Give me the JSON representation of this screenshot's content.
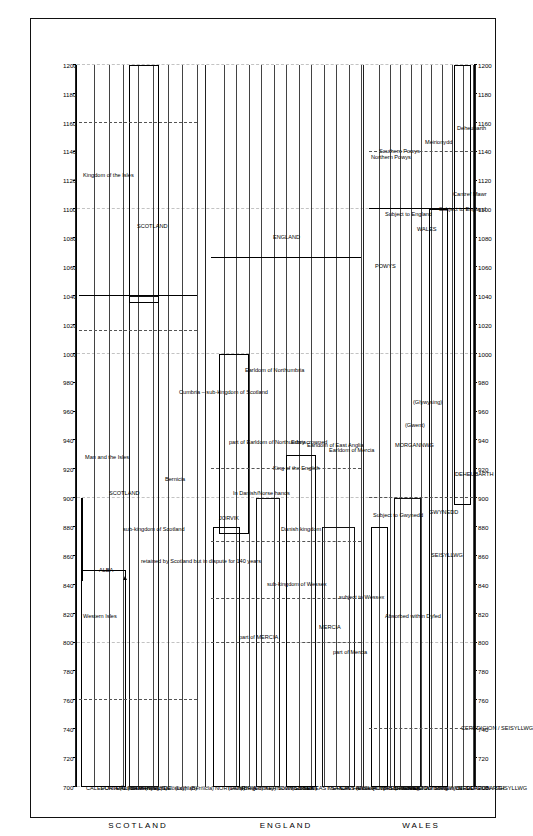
{
  "figure": {
    "orientation": "rotated-90-ccw",
    "axis_title": "",
    "era_labels": [
      "SCOTLAND",
      "ENGLAND",
      "WALES"
    ],
    "region_headers": [
      "SCOTLAND",
      "ENGLAND",
      "WALES"
    ]
  },
  "chart_data": {
    "type": "table",
    "title": "",
    "xlabel": "",
    "ylabel": "",
    "xlim": [
      700,
      1200
    ],
    "x_ticks": [
      700,
      720,
      740,
      760,
      780,
      800,
      820,
      840,
      860,
      880,
      900,
      920,
      940,
      960,
      980,
      1000,
      1020,
      1040,
      1060,
      1080,
      1100,
      1120,
      1140,
      1160,
      1180,
      1200
    ],
    "grid": "dashed-vertical",
    "legend": "none",
    "sections": [
      {
        "name": "SCOTLAND",
        "rows": [
          {
            "label": "CALEDONIA (Northern Picts)",
            "span": [
              700,
              850
            ]
          },
          {
            "label": "FORTRIU (Southern Picts)",
            "span": [
              700,
              850
            ]
          },
          {
            "label": "DÁL RIATA",
            "span": [
              700,
              850
            ]
          },
          {
            "label": "STRATHCLYDE",
            "span": [
              700,
              1040
            ]
          },
          {
            "label": "(Kyle)",
            "span": [
              700,
              760
            ]
          },
          {
            "label": "(Galloway)",
            "span": [
              700,
              1040
            ]
          },
          {
            "label": "(Lothian)",
            "span": [
              700,
              1020
            ]
          },
          {
            "label": "(Bernicia)",
            "span": [
              700,
              960
            ]
          }
        ],
        "annotations": [
          {
            "text": "Western Isles",
            "at": 840
          },
          {
            "text": "Man and the Isles",
            "at": 960
          },
          {
            "text": "Kingdom of the Isles",
            "at": 1150
          },
          {
            "text": "ALBA",
            "at": 870
          },
          {
            "text": "SCOTLAND",
            "at": 960
          },
          {
            "text": "sub-kingdom of Scotland",
            "at": 920
          },
          {
            "text": "retained by Scotland but in dispute for 140 years",
            "at": 940
          },
          {
            "text": "Bernicia",
            "at": 940
          },
          {
            "text": "Cumbria – sub-kingdom of Scotland",
            "at": 1010
          },
          {
            "text": "SCOTLAND",
            "at": 1110
          }
        ]
      },
      {
        "name": "ENGLAND",
        "rows": [
          {
            "label": "NORTHUMBRIA",
            "span": [
              700,
              880
            ]
          },
          {
            "label": "(Deira)",
            "span": [
              700,
              880
            ]
          },
          {
            "label": "(Rheged)",
            "span": [
              700,
              800
            ]
          },
          {
            "label": "(Lindsey)",
            "span": [
              700,
              830
            ]
          },
          {
            "label": "KERNOW (Cornwall)",
            "span": [
              700,
              900
            ]
          },
          {
            "label": "South Saxons",
            "span": [
              700,
              830
            ]
          },
          {
            "label": "WESSEX",
            "span": [
              700,
              920
            ]
          },
          {
            "label": "KENT",
            "span": [
              700,
              830
            ]
          },
          {
            "label": "EAST SAXONS (Essex)",
            "span": [
              700,
              830
            ]
          },
          {
            "label": "MERCIA",
            "span": [
              700,
              880
            ]
          },
          {
            "label": "EAST ANGLIA",
            "span": [
              700,
              870
            ]
          },
          {
            "label": "Hwicce (subject to Mercia)",
            "span": [
              700,
              800
            ]
          }
        ],
        "annotations": [
          {
            "text": "JORVIK",
            "at": 890
          },
          {
            "text": "In Danish/Norse hands",
            "at": 930
          },
          {
            "text": "part of Earldom of Northumbria",
            "at": 960
          },
          {
            "text": "Earldom of Northumbria",
            "at": 1010
          },
          {
            "text": "part of MERCIA",
            "at": 820
          },
          {
            "text": "sub-kingdom of Wessex",
            "at": 870
          },
          {
            "text": "Danish kingdom",
            "at": 900
          },
          {
            "text": "Earldom of East Anglia",
            "at": 965
          },
          {
            "text": "Earldom of Mercia",
            "at": 960
          },
          {
            "text": "MERCIA",
            "at": 830
          },
          {
            "text": "part of Mercia",
            "at": 820
          },
          {
            "text": "subject to Wessex",
            "at": 850
          },
          {
            "text": "King of the English",
            "at": 950
          },
          {
            "text": "Edwy crowned",
            "at": 955
          },
          {
            "text": "ENGLAND",
            "at": 1090
          }
        ]
      },
      {
        "name": "WALES",
        "rows": [
          {
            "label": "POWYS (Northern)",
            "span": [
              700,
              880
            ]
          },
          {
            "label": "BRECHEINIOG",
            "span": [
              700,
              720
            ]
          },
          {
            "label": "BRYCHEINIOG",
            "span": [
              700,
              900
            ]
          },
          {
            "label": "GWENT",
            "span": [
              700,
              900
            ]
          },
          {
            "label": "GLYWYSING",
            "span": [
              700,
              900
            ]
          },
          {
            "label": "Dunoding",
            "span": [
              700,
              740
            ]
          },
          {
            "label": "Meirionydd",
            "span": [
              700,
              740
            ]
          },
          {
            "label": "GWYNEDD",
            "span": [
              700,
              1100
            ]
          },
          {
            "label": "CEREDIGION / SEISYLLWG",
            "span": [
              700,
              900
            ]
          },
          {
            "label": "DEHEUBARTH",
            "span": [
              900,
              1200
            ]
          }
        ],
        "annotations": [
          {
            "text": "Subject to Gwynedd",
            "at": 910
          },
          {
            "text": "Absorbed within Dyfed",
            "at": 840
          },
          {
            "text": "MORGANNWG",
            "at": 960
          },
          {
            "text": "(Gwent)",
            "at": 970
          },
          {
            "text": "(Glywysing)",
            "at": 985
          },
          {
            "text": "POWYS",
            "at": 1080
          },
          {
            "text": "Subject to England",
            "at": 1110
          },
          {
            "text": "Northern Powys",
            "at": 1160
          },
          {
            "text": "Southern Powys",
            "at": 1165
          },
          {
            "text": "Meirionydd",
            "at": 1165
          },
          {
            "text": "Cantref Mawr",
            "at": 1150
          },
          {
            "text": "Deheubarth",
            "at": 1170
          },
          {
            "text": "SEISYLLWG",
            "at": 890
          },
          {
            "text": "DEHEUBARTH",
            "at": 940
          },
          {
            "text": "GWYNEDD",
            "at": 920
          },
          {
            "text": "CEREDIGION / SEISYLLWG",
            "at": 780
          },
          {
            "text": "WALES",
            "at": 1110
          },
          {
            "text": "Subject to England",
            "at": 1110
          }
        ]
      }
    ]
  },
  "ticks": [
    "700",
    "720",
    "740",
    "760",
    "780",
    "800",
    "820",
    "840",
    "860",
    "880",
    "900",
    "920",
    "940",
    "960",
    "980",
    "1000",
    "1020",
    "1040",
    "1060",
    "1080",
    "1100",
    "1120",
    "1140",
    "1160",
    "1180",
    "1200"
  ],
  "regions": {
    "scotland": "SCOTLAND",
    "england": "ENGLAND",
    "wales": "WALES"
  },
  "rows": {
    "caledonia": "CALEDONIA (Northern Picts)",
    "fortriu": "FORTRIU (Southern Picts)",
    "dalriata": "DÁL RIATA",
    "strathclyde": "STRATHCLYDE",
    "kyle": "(Kyle)",
    "galloway": "(Galloway)",
    "lothian": "(Lothian)",
    "bernicia_row": "(Bernicia)",
    "northumbria": "NORTHUMBRIA",
    "deira": "(Deira)",
    "rheged": "(Rheged)",
    "lindsey": "(Lindsey)",
    "kernow": "KERNOW (Cornwall)",
    "south_saxons": "South Saxons",
    "wessex": "WESSEX",
    "kent": "KENT",
    "east_saxons": "EAST SAXONS (Essex)",
    "mercia": "MERCIA",
    "east_anglia": "EAST ANGLIA",
    "hwicce": "Hwicce (subject to Mercia)",
    "powys_northern": "POWYS (Northern)",
    "brecheiniog": "BRECHEINIOG",
    "brycheiniog": "BRYCHEINIOG",
    "gwent": "GWENT",
    "glywysing": "GLYWYSING",
    "dunoding": "Dunoding",
    "meirionydd": "Meirionydd",
    "ceredigion": "CEREDIGION / DYFED"
  },
  "annotations": {
    "western_isles": "Western Isles",
    "man_and_isles": "Man and the Isles",
    "kingdom_of_isles": "Kingdom of the Isles",
    "alba": "ALBA",
    "scotland_mid": "SCOTLAND",
    "sub_kingdom_scotland": "sub-kingdom of Scotland",
    "retained_scotland": "retained by Scotland but in dispute for 140 years",
    "bernicia": "Bernicia",
    "cumbria": "Cumbria – sub-kingdom of Scotland",
    "scotland_right": "SCOTLAND",
    "jorvik": "JORVIK",
    "danish_norse": "In Danish/Norse hands",
    "part_earldom_north": "part of Earldom of Northumbria",
    "earldom_northumbria": "Earldom of Northumbria",
    "part_of_mercia_big": "part of MERCIA",
    "sub_kingdom_wessex": "sub-kingdom of Wessex",
    "danish_kingdom": "Danish kingdom",
    "earldom_east_anglia": "Earldom of East Anglia",
    "earldom_mercia": "Earldom of Mercia",
    "mercia_mid": "MERCIA",
    "part_of_mercia_small": "part of Mercia",
    "subject_to_wessex": "subject to Wessex",
    "king_of_english": "King of the English",
    "edwy_crowned": "Edwy crowned",
    "england_right": "ENGLAND",
    "subject_to_gwynedd": "Subject to Gwynedd",
    "absorbed_dyfed": "Absorbed within Dyfed",
    "morgannwg": "MORGANNWG",
    "gwent_paren": "(Gwent)",
    "glywysing_paren": "(Glywysing)",
    "powys_right": "POWYS",
    "subject_to_england_1": "Subject to England",
    "subject_to_england_2": "Subject to England",
    "northern_powys": "Northern Powys",
    "southern_powys": "Southern Powys",
    "meirionydd_right": "Meirionydd",
    "cantref_mawr": "Cantref Mawr",
    "deheubarth_right": "Deheubarth",
    "brycheiniog_mid": "BRYCHEINIOG",
    "seisyllwg": "SEISYLLWG",
    "deheubarth_mid": "DEHEUBARTH",
    "gwynedd_mid": "GWYNEDD",
    "ceredigion_seisyllwg": "CEREDIGION / SEISYLLWG",
    "wales_right": "WALES"
  }
}
